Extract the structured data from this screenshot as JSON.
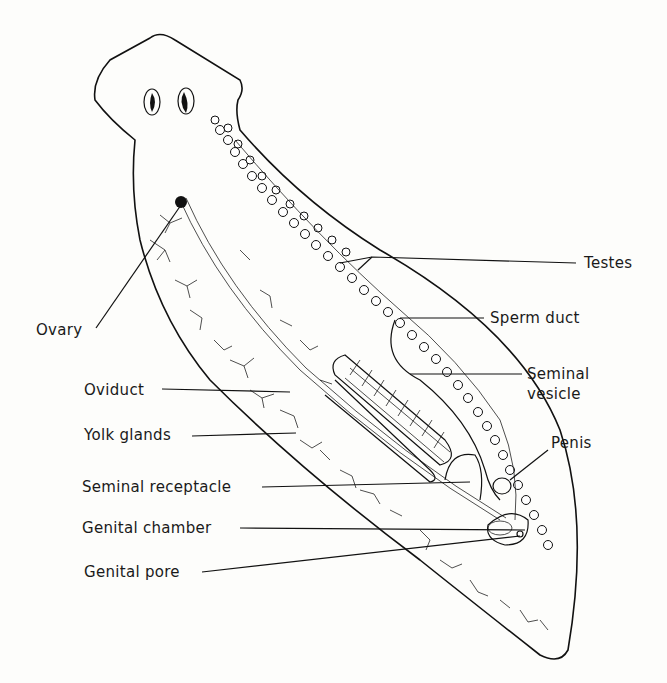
{
  "diagram": {
    "labels": {
      "testes": "Testes",
      "sperm_duct": "Sperm duct",
      "seminal_vesicle_1": "Seminal",
      "seminal_vesicle_2": "vesicle",
      "penis": "Penis",
      "ovary": "Ovary",
      "oviduct": "Oviduct",
      "yolk_glands": "Yolk glands",
      "seminal_receptacle": "Seminal receptacle",
      "genital_chamber": "Genital chamber",
      "genital_pore": "Genital pore"
    },
    "colors": {
      "ink": "#111111",
      "background": "#fdfdfb"
    }
  }
}
